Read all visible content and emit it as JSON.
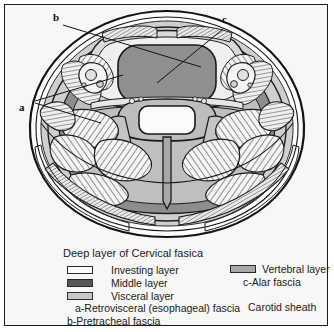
{
  "figure": {
    "callouts": [
      {
        "key": "a",
        "label": "a"
      },
      {
        "key": "b",
        "label": "b"
      },
      {
        "key": "c",
        "label": "c"
      }
    ]
  },
  "legend": {
    "title": "Deep layer of Cervical fasica",
    "items": [
      {
        "label": "Investing layer",
        "color": "#ffffff"
      },
      {
        "label": "Middle layer",
        "color": "#565656"
      },
      {
        "label": "Visceral layer",
        "color": "#c6c6c6"
      }
    ],
    "vertebral": {
      "label": "Vertebral layer",
      "color": "#a9a9a9"
    },
    "alar": "c-Alar fascia",
    "carotid": "Carotid sheath",
    "retrovisceral": "a-Retrovisceral (esophageal) fascia",
    "pretracheal": "b-Pretracheal fascia"
  },
  "colors": {
    "ink": "#1a1a1a",
    "page": "#f7f7f5",
    "fascia_mid": "#8d8d8d",
    "fascia_light": "#cfcfcf",
    "muscle": "#f2f2f0",
    "trachea": "#8f8f8f",
    "bone": "#bdbdbd"
  }
}
